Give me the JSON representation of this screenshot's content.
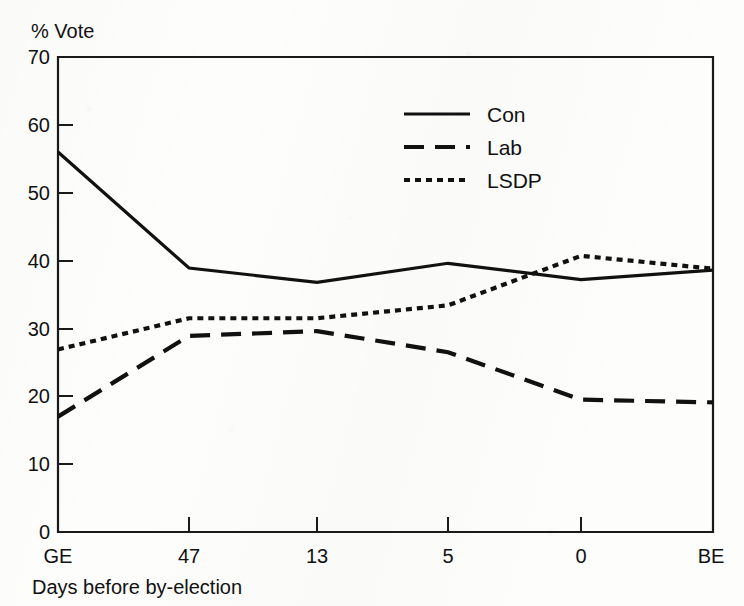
{
  "chart_data": {
    "type": "line",
    "title": "",
    "ylabel": "% Vote",
    "xlabel": "Days before by-election",
    "categories": [
      "GE",
      "47",
      "13",
      "5",
      "0",
      "BE"
    ],
    "x_tick_labels": [
      "GE",
      "47",
      "13",
      "5",
      "0",
      "BE"
    ],
    "y_tick_labels": [
      "0",
      "10",
      "20",
      "30",
      "40",
      "50",
      "60",
      "70"
    ],
    "y_ticks": [
      0,
      10,
      20,
      30,
      40,
      50,
      60,
      70
    ],
    "ylim": [
      0,
      70
    ],
    "grid": false,
    "legend_position": "upper-center-right",
    "series": [
      {
        "name": "Con",
        "style": "solid",
        "values": [
          56.0,
          38.9,
          36.8,
          39.6,
          37.2,
          38.6
        ]
      },
      {
        "name": "Lab",
        "style": "dashed",
        "values": [
          17.0,
          28.9,
          29.6,
          26.5,
          19.5,
          19.1
        ]
      },
      {
        "name": "LSDP",
        "style": "dotted",
        "values": [
          26.9,
          31.5,
          31.5,
          33.4,
          40.7,
          38.8
        ]
      }
    ]
  },
  "axes": {
    "y_axis_caption": "% Vote",
    "x_axis_caption": "Days before by-election"
  },
  "legend": {
    "entries": [
      {
        "label": "Con",
        "style": "solid"
      },
      {
        "label": "Lab",
        "style": "dashed"
      },
      {
        "label": "LSDP",
        "style": "dotted"
      }
    ]
  },
  "colors": {
    "ink": "#111111",
    "paper": "#fdfdfc"
  }
}
